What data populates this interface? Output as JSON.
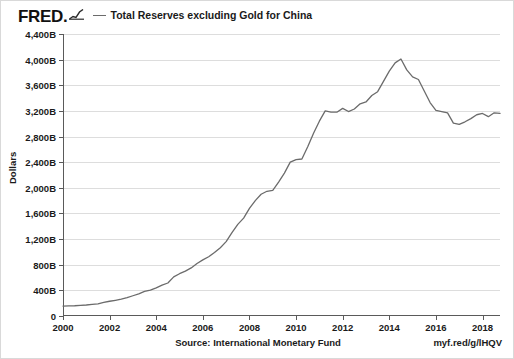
{
  "brand": {
    "wordmark": "FRED.",
    "spark_icon": "sparkline-icon"
  },
  "legend": {
    "entries": [
      {
        "label": "Total Reserves excluding Gold for China",
        "color": "#6b6b6b"
      }
    ]
  },
  "footer": {
    "source": "Source: International Monetary Fund",
    "short_url": "myf.red/g/lHQV"
  },
  "chart_data": {
    "type": "line",
    "title": "Total Reserves excluding Gold for China",
    "xlabel": "",
    "ylabel": "Dollars",
    "ylim": [
      0,
      4400
    ],
    "xlim": [
      2000,
      2018.75
    ],
    "grid": true,
    "legend_position": "top",
    "y_ticks": [
      0,
      400,
      800,
      1200,
      1600,
      2000,
      2400,
      2800,
      3200,
      3600,
      4000,
      4400
    ],
    "y_tick_labels": [
      "0",
      "400B",
      "800B",
      "1,200B",
      "1,600B",
      "2,000B",
      "2,400B",
      "2,800B",
      "3,200B",
      "3,600B",
      "4,000B",
      "4,400B"
    ],
    "x_ticks": [
      2000,
      2002,
      2004,
      2006,
      2008,
      2010,
      2012,
      2014,
      2016,
      2018
    ],
    "x_tick_labels": [
      "2000",
      "2002",
      "2004",
      "2006",
      "2008",
      "2010",
      "2012",
      "2014",
      "2016",
      "2018"
    ],
    "series": [
      {
        "name": "Total Reserves excluding Gold for China",
        "color": "#6b6b6b",
        "units": "Billions of Dollars",
        "x": [
          2000.0,
          2000.25,
          2000.5,
          2000.75,
          2001.0,
          2001.25,
          2001.5,
          2001.75,
          2002.0,
          2002.25,
          2002.5,
          2002.75,
          2003.0,
          2003.25,
          2003.5,
          2003.75,
          2004.0,
          2004.25,
          2004.5,
          2004.75,
          2005.0,
          2005.25,
          2005.5,
          2005.75,
          2006.0,
          2006.25,
          2006.5,
          2006.75,
          2007.0,
          2007.25,
          2007.5,
          2007.75,
          2008.0,
          2008.25,
          2008.5,
          2008.75,
          2009.0,
          2009.25,
          2009.5,
          2009.75,
          2010.0,
          2010.25,
          2010.5,
          2010.75,
          2011.0,
          2011.25,
          2011.5,
          2011.75,
          2012.0,
          2012.25,
          2012.5,
          2012.75,
          2013.0,
          2013.25,
          2013.5,
          2013.75,
          2014.0,
          2014.25,
          2014.5,
          2014.75,
          2015.0,
          2015.25,
          2015.5,
          2015.75,
          2016.0,
          2016.25,
          2016.5,
          2016.75,
          2017.0,
          2017.25,
          2017.5,
          2017.75,
          2018.0,
          2018.25,
          2018.5,
          2018.75
        ],
        "y": [
          155,
          157,
          160,
          166,
          172,
          180,
          190,
          212,
          230,
          245,
          262,
          286,
          316,
          345,
          383,
          403,
          440,
          483,
          515,
          610,
          660,
          700,
          750,
          819,
          875,
          925,
          990,
          1066,
          1160,
          1300,
          1430,
          1528,
          1680,
          1800,
          1900,
          1946,
          1960,
          2090,
          2230,
          2400,
          2440,
          2450,
          2640,
          2850,
          3040,
          3200,
          3180,
          3180,
          3240,
          3190,
          3230,
          3310,
          3340,
          3440,
          3500,
          3660,
          3820,
          3950,
          4010,
          3840,
          3730,
          3690,
          3510,
          3330,
          3210,
          3190,
          3170,
          3010,
          2990,
          3030,
          3080,
          3140,
          3160,
          3110,
          3170,
          3160
        ]
      }
    ]
  }
}
